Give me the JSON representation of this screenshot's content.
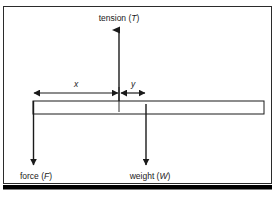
{
  "figure": {
    "kind": "free-body-diagram",
    "background_color": "#ffffff",
    "stroke_color": "#1a1a1a",
    "border": {
      "outer_frame_color": "#1a1a1a",
      "bottom_bar_color": "#000000"
    },
    "labels": {
      "tension": {
        "text_prefix": "tension (",
        "symbol": "T",
        "text_suffix": ")"
      },
      "force": {
        "text_prefix": "force (",
        "symbol": "F",
        "text_suffix": ")"
      },
      "weight": {
        "text_prefix": "weight (",
        "symbol": "W",
        "text_suffix": ")"
      },
      "distance_x": {
        "symbol": "x"
      },
      "distance_y": {
        "symbol": "y"
      }
    },
    "beam": {
      "name": "horizontal-beam",
      "fill": "#ffffff",
      "stroke": "#1a1a1a"
    },
    "arrows": {
      "tension": {
        "direction": "up"
      },
      "force": {
        "direction": "down"
      },
      "weight": {
        "direction": "down"
      },
      "distance_x": {
        "direction": "both"
      },
      "distance_y": {
        "direction": "both"
      }
    }
  }
}
